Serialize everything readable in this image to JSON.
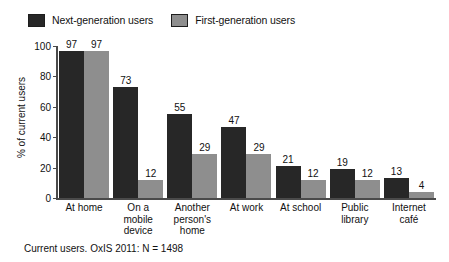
{
  "chart_data": {
    "type": "bar",
    "title": "",
    "xlabel": "",
    "ylabel": "% of current users",
    "ylim": [
      0,
      100
    ],
    "yticks": [
      100,
      80,
      60,
      40,
      20,
      0
    ],
    "grid": false,
    "legend_position": "top-left",
    "categories": [
      "At home",
      "On a mobile device",
      "Another person's home",
      "At work",
      "At school",
      "Public library",
      "Internet café"
    ],
    "category_lines": [
      [
        "At home"
      ],
      [
        "On a",
        "mobile",
        "device"
      ],
      [
        "Another",
        "person's",
        "home"
      ],
      [
        "At work"
      ],
      [
        "At school"
      ],
      [
        "Public",
        "library"
      ],
      [
        "Internet",
        "café"
      ]
    ],
    "series": [
      {
        "name": "Next-generation users",
        "color": "#272727",
        "values": [
          97,
          73,
          55,
          47,
          21,
          19,
          13
        ]
      },
      {
        "name": "First-generation users",
        "color": "#8e8e8e",
        "values": [
          97,
          12,
          29,
          29,
          12,
          12,
          4
        ]
      }
    ],
    "annotations": [
      "Current users. OxIS 2011: N = 1498"
    ]
  },
  "legend": {
    "items": [
      {
        "label": "Next-generation users",
        "color": "#272727"
      },
      {
        "label": "First-generation users",
        "color": "#8e8e8e"
      }
    ]
  },
  "axes": {
    "y_title": "% of current users",
    "y_ticks": [
      "100",
      "80",
      "60",
      "40",
      "20",
      "0"
    ]
  },
  "caption": {
    "text": "Current users. OxIS 2011: N = 1498"
  },
  "colors": {
    "next_generation": "#272727",
    "first_generation": "#8e8e8e",
    "axis": "#4a4a4a",
    "text": "#111111",
    "background": "#ffffff"
  }
}
